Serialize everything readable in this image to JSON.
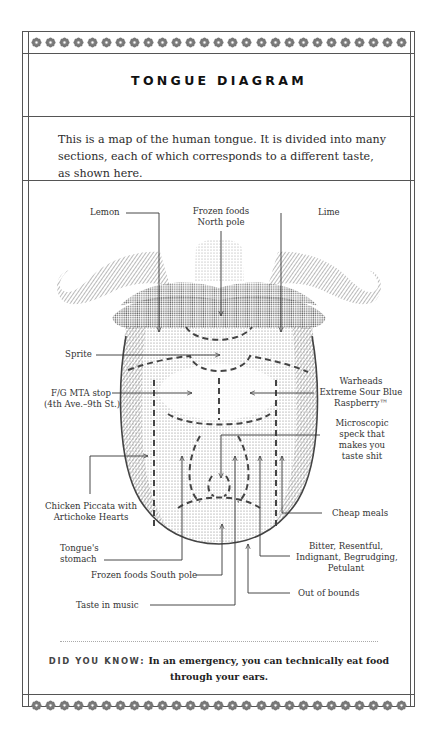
{
  "title": "TONGUE DIAGRAM",
  "intro": "This is a map of the human tongue. It is divided into many sections, each of which corresponds to a different taste, as shown here.",
  "ornament": {
    "icon": "flower-rosette-icon",
    "count": 27,
    "color": "#777777"
  },
  "labels": {
    "lemon": "Lemon",
    "frozen_north_1": "Frozen foods",
    "frozen_north_2": "North pole",
    "lime": "Lime",
    "sprite": "Sprite",
    "fg_1": "F/G MTA stop",
    "fg_2": "(4th Ave.–9th St.)",
    "warheads_1": "Warheads",
    "warheads_2": "Extreme Sour Blue",
    "warheads_3": "Raspberry™",
    "speck_1": "Microscopic",
    "speck_2": "speck that",
    "speck_3": "makes you",
    "speck_4": "taste shit",
    "chicken_1": "Chicken Piccata with",
    "chicken_2": "Artichoke Hearts",
    "cheap": "Cheap meals",
    "stomach_1": "Tongue's",
    "stomach_2": "stomach",
    "bitter_1": "Bitter, Resentful,",
    "bitter_2": "Indignant, Begrudging,",
    "bitter_3": "Petulant",
    "frozen_south": "Frozen foods South pole",
    "out_of_bounds": "Out of bounds",
    "music": "Taste in music"
  },
  "did_you_know": {
    "label": "DID YOU KNOW:",
    "text": "In an emergency, you can technically eat food through your ears."
  }
}
